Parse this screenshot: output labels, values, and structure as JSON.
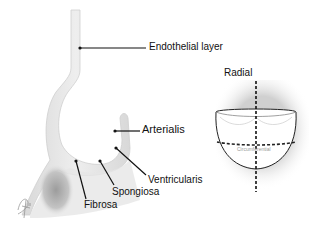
{
  "diagram": {
    "labels": {
      "endothelial_layer": "Endothelial layer",
      "arterialis": "Arterialis",
      "ventricularis": "Ventricularis",
      "spongiosa": "Spongiosa",
      "fibrosa": "Fibrosa",
      "radial": "Radial",
      "circumferential": "Circumferential"
    },
    "colors": {
      "tissue": "#e4e4e4",
      "tissue_edge": "#c9c9c9",
      "fibrosa_shading": "#a8a8a8",
      "leader_line": "#111111",
      "cusp_outline": "#222222",
      "circumferential_label": "#9a9a9a"
    }
  }
}
